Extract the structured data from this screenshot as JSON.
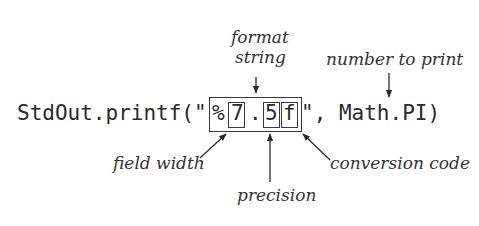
{
  "diagram": {
    "code": {
      "prefix": "StdOut.printf(\"",
      "percent": "%",
      "width_digit": "7",
      "dot": ".",
      "precision_digit": "5",
      "conversion_char": "f",
      "suffix": "\", Math.PI)"
    },
    "labels": {
      "format_string_line1": "format",
      "format_string_line2": "string",
      "number_to_print": "number to print",
      "field_width": "field width",
      "precision": "precision",
      "conversion_code": "conversion  code"
    },
    "colors": {
      "ink": "#2a2a2a",
      "background": "#ffffff"
    }
  }
}
